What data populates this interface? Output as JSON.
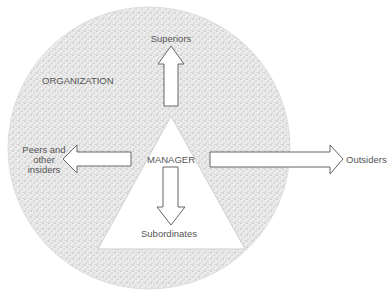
{
  "diagram": {
    "type": "manager-relationships",
    "colors": {
      "background": "#ffffff",
      "organization_fill": "#e4e4e4",
      "stipple": "#8a8a8a",
      "outline": "#666666",
      "text": "#555555"
    },
    "organization": {
      "label": "ORGANIZATION"
    },
    "manager": {
      "label": "MANAGER"
    },
    "arrows": [
      {
        "direction": "up",
        "target": "Superiors"
      },
      {
        "direction": "down",
        "target": "Subordinates"
      },
      {
        "direction": "left",
        "target_lines": [
          "Peers and",
          "other",
          "insiders"
        ]
      },
      {
        "direction": "right",
        "target": "Outsiders"
      }
    ]
  }
}
